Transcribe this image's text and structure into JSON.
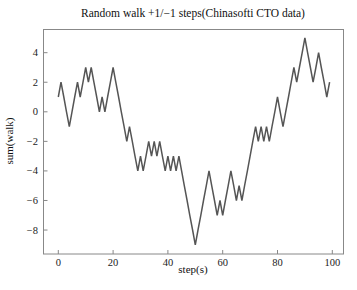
{
  "chart_data": {
    "type": "line",
    "title": "Random walk +1/−1 steps(Chinasofti CTO data)",
    "xlabel": "step(s)",
    "ylabel": "sum(walk)",
    "xlim": [
      -4,
      103
    ],
    "ylim": [
      -9.7,
      5.6
    ],
    "xticks": [
      0,
      20,
      40,
      60,
      80,
      100
    ],
    "yticks": [
      4,
      2,
      0,
      -2,
      -4,
      -6,
      -8
    ],
    "ytick_labels": [
      "4",
      "2",
      "0",
      "−2",
      "−4",
      "−6",
      "−8"
    ],
    "grid": false,
    "legend": null,
    "line_color": "#555555",
    "series": [
      {
        "name": "walk",
        "x": [
          0,
          1,
          2,
          3,
          4,
          5,
          6,
          7,
          8,
          9,
          10,
          11,
          12,
          13,
          14,
          15,
          16,
          17,
          18,
          19,
          20,
          21,
          22,
          23,
          24,
          25,
          26,
          27,
          28,
          29,
          30,
          31,
          32,
          33,
          34,
          35,
          36,
          37,
          38,
          39,
          40,
          41,
          42,
          43,
          44,
          45,
          46,
          47,
          48,
          49,
          50,
          51,
          52,
          53,
          54,
          55,
          56,
          57,
          58,
          59,
          60,
          61,
          62,
          63,
          64,
          65,
          66,
          67,
          68,
          69,
          70,
          71,
          72,
          73,
          74,
          75,
          76,
          77,
          78,
          79,
          80,
          81,
          82,
          83,
          84,
          85,
          86,
          87,
          88,
          89,
          90,
          91,
          92,
          93,
          94,
          95,
          96,
          97,
          98,
          99
        ],
        "values": [
          1,
          2,
          1,
          0,
          -1,
          0,
          1,
          2,
          1,
          2,
          3,
          2,
          3,
          2,
          1,
          0,
          1,
          0,
          1,
          2,
          3,
          2,
          1,
          0,
          -1,
          -2,
          -1,
          -2,
          -3,
          -4,
          -3,
          -4,
          -3,
          -2,
          -3,
          -2,
          -3,
          -2,
          -3,
          -4,
          -3,
          -4,
          -3,
          -4,
          -3,
          -4,
          -5,
          -6,
          -7,
          -8,
          -9,
          -8,
          -7,
          -6,
          -5,
          -4,
          -5,
          -6,
          -7,
          -6,
          -7,
          -6,
          -5,
          -4,
          -5,
          -6,
          -5,
          -6,
          -5,
          -4,
          -3,
          -2,
          -1,
          -2,
          -1,
          -2,
          -1,
          -2,
          -1,
          0,
          1,
          0,
          -1,
          0,
          1,
          2,
          3,
          2,
          3,
          4,
          5,
          4,
          3,
          2,
          3,
          4,
          3,
          2,
          1,
          2
        ]
      }
    ]
  }
}
